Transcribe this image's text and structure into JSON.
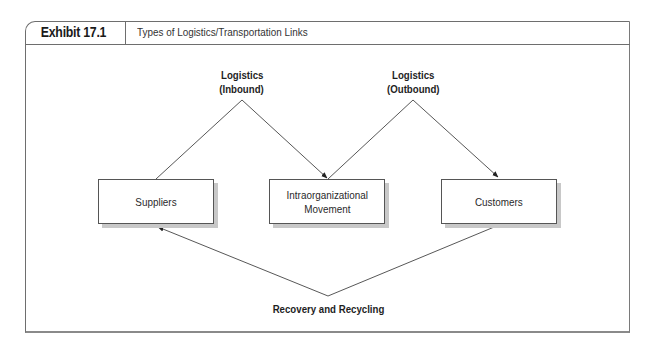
{
  "exhibit": {
    "label": "Exhibit 17.1",
    "title": "Types of Logistics/Transportation Links"
  },
  "nodes": {
    "suppliers": "Suppliers",
    "intraorganizational_line1": "Intraorganizational",
    "intraorganizational_line2": "Movement",
    "customers": "Customers"
  },
  "flows": {
    "inbound_line1": "Logistics",
    "inbound_line2": "(Inbound)",
    "outbound_line1": "Logistics",
    "outbound_line2": "(Outbound)",
    "recovery": "Recovery and Recycling"
  },
  "edges": [
    {
      "from": "suppliers",
      "to": "intraorganizational",
      "label": "Logistics (Inbound)",
      "arrow_at": "intraorganizational"
    },
    {
      "from": "intraorganizational",
      "to": "customers",
      "label": "Logistics (Outbound)",
      "arrow_at": "customers"
    },
    {
      "from": "customers",
      "to": "suppliers",
      "label": "Recovery and Recycling",
      "arrow_at": "suppliers"
    }
  ]
}
